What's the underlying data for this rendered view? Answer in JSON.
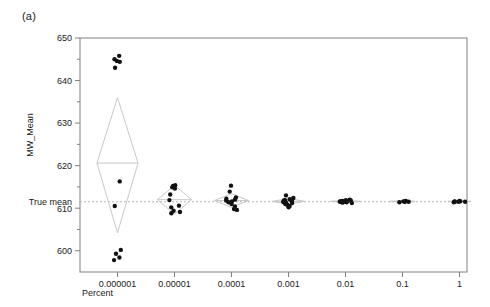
{
  "panel": {
    "label": "(a)"
  },
  "chart_data": {
    "type": "scatter",
    "title": "",
    "xlabel": "Percent",
    "ylabel": "MW_Mean",
    "xscale": "log",
    "categories": [
      "0.000001",
      "0.00001",
      "0.0001",
      "0.001",
      "0.01",
      "0.1",
      "1"
    ],
    "xtick_labels": [
      "0.000001",
      "0.00001",
      "0.0001",
      "0.001",
      "0.01",
      "0.1",
      "1"
    ],
    "ytick_labels": [
      "600",
      "610",
      "620",
      "630",
      "640",
      "650"
    ],
    "ytick_values": [
      600,
      610,
      620,
      630,
      640,
      650
    ],
    "yminor_values": [
      605,
      615,
      625,
      635,
      645
    ],
    "ylim": [
      595,
      650
    ],
    "grid": false,
    "reference_line": {
      "label": "True mean",
      "value": 611.5,
      "style": "dashed"
    },
    "marker": {
      "shape": "circle",
      "color": "#111111",
      "size": 2.2
    },
    "diamond_color": "#c9c9c9",
    "axis_color": "#808080",
    "groups": [
      {
        "category": "0.000001",
        "mean": 620.6,
        "diamond": {
          "top": 636.0,
          "bottom": 604.2,
          "half_width": 0.36
        },
        "values": [
          645.8,
          645.0,
          644.6,
          644.4,
          643.0,
          616.3,
          610.5,
          600.2,
          599.3,
          598.4,
          597.8
        ]
      },
      {
        "category": "0.00001",
        "mean": 612.0,
        "diamond": {
          "top": 615.4,
          "bottom": 608.6,
          "half_width": 0.3
        },
        "values": [
          615.4,
          615.2,
          614.9,
          614.6,
          613.2,
          611.9,
          610.6,
          610.2,
          609.4,
          609.1,
          608.8
        ]
      },
      {
        "category": "0.0001",
        "mean": 611.8,
        "diamond": {
          "top": 613.4,
          "bottom": 610.2,
          "half_width": 0.3
        },
        "values": [
          615.3,
          613.9,
          612.5,
          612.2,
          612.0,
          611.8,
          611.6,
          611.4,
          611.0,
          610.4,
          609.8,
          609.6
        ]
      },
      {
        "category": "0.001",
        "mean": 611.6,
        "diamond": {
          "top": 612.3,
          "bottom": 610.9,
          "half_width": 0.28
        },
        "values": [
          613.0,
          612.4,
          612.1,
          611.9,
          611.8,
          611.7,
          611.6,
          611.5,
          611.4,
          611.3,
          611.2,
          611.0,
          610.8,
          610.5,
          610.2
        ]
      },
      {
        "category": "0.01",
        "mean": 611.6,
        "diamond": {
          "top": 611.9,
          "bottom": 611.3,
          "half_width": 0.26
        },
        "values": [
          612.0,
          611.9,
          611.8,
          611.7,
          611.6,
          611.6,
          611.5,
          611.5,
          611.4,
          611.3,
          611.2
        ]
      },
      {
        "category": "0.1",
        "mean": 611.6,
        "diamond": {
          "top": 611.8,
          "bottom": 611.4,
          "half_width": 0.22
        },
        "values": [
          611.7,
          611.6,
          611.6,
          611.5,
          611.5,
          611.4
        ]
      },
      {
        "category": "1",
        "mean": 611.6,
        "diamond": {
          "top": 611.7,
          "bottom": 611.5,
          "half_width": 0.2
        },
        "values": [
          611.7,
          611.6,
          611.6,
          611.5,
          611.5,
          611.5,
          611.4
        ]
      }
    ]
  }
}
